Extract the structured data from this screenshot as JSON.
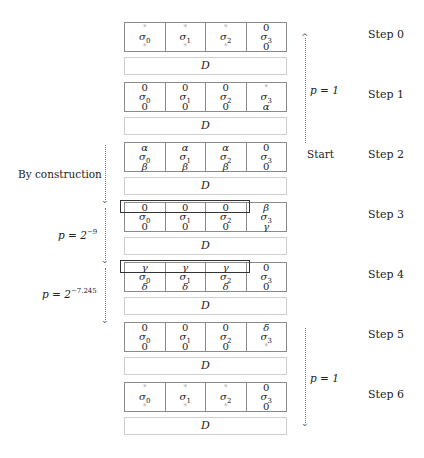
{
  "steps": [
    {
      "label": "Step 0",
      "top": 22,
      "cells": [
        [
          "*",
          "σ",
          "0",
          "*"
        ],
        [
          "*",
          "σ",
          "1",
          "*"
        ],
        [
          "*",
          "σ",
          "2",
          "*"
        ],
        [
          "0",
          "σ",
          "3",
          "0"
        ]
      ]
    },
    {
      "label": "Step 1",
      "top": 82,
      "cells": [
        [
          "0",
          "σ",
          "0",
          "0"
        ],
        [
          "0",
          "σ",
          "1",
          "0"
        ],
        [
          "0",
          "σ",
          "2",
          "0"
        ],
        [
          "*",
          "σ",
          "3",
          "α"
        ]
      ]
    },
    {
      "label": "Step 2",
      "top": 142,
      "cells": [
        [
          "α",
          "σ",
          "0",
          "β"
        ],
        [
          "α",
          "σ",
          "1",
          "β"
        ],
        [
          "α",
          "σ",
          "2",
          "β"
        ],
        [
          "0",
          "σ",
          "3",
          "0"
        ]
      ]
    },
    {
      "label": "Step 3",
      "top": 202,
      "cells": [
        [
          "0",
          "σ",
          "0",
          "0"
        ],
        [
          "0",
          "σ",
          "1",
          "0"
        ],
        [
          "0",
          "σ",
          "2",
          "0"
        ],
        [
          "β",
          "σ",
          "3",
          "γ"
        ]
      ]
    },
    {
      "label": "Step 4",
      "top": 262,
      "cells": [
        [
          "γ",
          "σ",
          "0",
          "δ"
        ],
        [
          "γ",
          "σ",
          "1",
          "δ"
        ],
        [
          "γ",
          "σ",
          "2",
          "δ"
        ],
        [
          "0",
          "σ",
          "3",
          "0"
        ]
      ]
    },
    {
      "label": "Step 5",
      "top": 322,
      "cells": [
        [
          "0",
          "σ",
          "0",
          "0"
        ],
        [
          "0",
          "σ",
          "1",
          "0"
        ],
        [
          "0",
          "σ",
          "2",
          "0"
        ],
        [
          "δ",
          "σ",
          "3",
          "*"
        ]
      ]
    },
    {
      "label": "Step 6",
      "top": 382,
      "cells": [
        [
          "*",
          "σ",
          "0",
          "*"
        ],
        [
          "*",
          "σ",
          "1",
          "*"
        ],
        [
          "*",
          "σ",
          "2",
          "*"
        ],
        [
          "0",
          "σ",
          "3",
          "0"
        ]
      ]
    }
  ],
  "d_label": "D",
  "annotations": {
    "start": "Start",
    "p1_top": "p = 1",
    "by_construction": "By construction",
    "p_step3": "p = 2",
    "p_step3_exp": "−9",
    "p_step4": "p = 2",
    "p_step4_exp": "−7.245",
    "p1_bottom": "p = 1"
  }
}
